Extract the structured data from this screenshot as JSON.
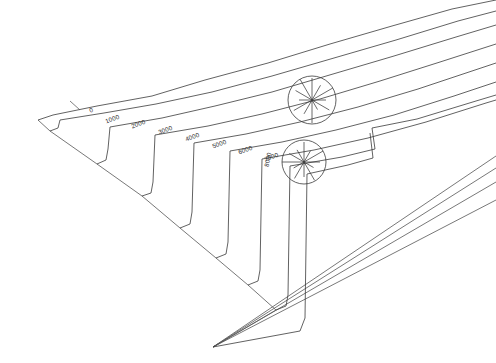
{
  "figure": {
    "background_color": "#ffffff",
    "line_color": "#3a3a3a",
    "faint_line_color": "#6e6e6e",
    "width": 496,
    "height": 363
  },
  "chart_data": {
    "type": "line",
    "title": "",
    "xlabel": "",
    "ylabel": "",
    "grid": false,
    "legend_position": "none",
    "contour_interval": 1000,
    "categories": [
      "0",
      "1000",
      "2000",
      "3000",
      "4000",
      "5000",
      "6000",
      "7000",
      "8000"
    ],
    "values": [
      0,
      1000,
      2000,
      3000,
      4000,
      5000,
      6000,
      7000,
      8000
    ],
    "series": [
      {
        "name": "contour-0",
        "label": "0",
        "label_x": 92,
        "label_y": 112,
        "label_rotation": -20,
        "path": "M 38 120 L 53 115 L 97 106 L 152 96 L 205 80 L 268 63 L 330 44 L 392 26 L 452 9 L 496 0"
      },
      {
        "name": "contour-1000",
        "label": "1000",
        "label_x": 113,
        "label_y": 121,
        "label_rotation": -20,
        "path": "M 50 131 L 58 128 L 60 120 L 104 113 L 156 104 L 212 92 L 272 76 L 334 58 L 396 40 L 458 21 L 496 11"
      },
      {
        "name": "contour-2000",
        "label": "2000",
        "label_x": 139,
        "label_y": 126,
        "label_rotation": -20,
        "path": "M 97 164 L 106 160 L 108 149 L 110 127 L 162 118 L 215 106 L 272 92 L 333 74 L 394 56 L 456 37 L 496 25"
      },
      {
        "name": "contour-3000",
        "label": "3000",
        "label_x": 166,
        "label_y": 132,
        "label_rotation": -20,
        "path": "M 142 196 L 151 193 L 153 182 L 155 135 L 208 126 L 262 114 L 320 99 L 380 81 L 440 62 L 496 44"
      },
      {
        "name": "contour-4000",
        "label": "4000",
        "label_x": 193,
        "label_y": 139,
        "label_rotation": -20,
        "path": "M 180 228 L 190 224 L 192 212 L 194 143 L 246 134 L 300 122 L 358 107 L 418 89 L 478 69 L 496 63"
      },
      {
        "name": "contour-5000",
        "label": "5000",
        "label_x": 220,
        "label_y": 146,
        "label_rotation": -20,
        "path": "M 216 258 L 226 254 L 228 242 L 230 151 L 282 142 L 336 130 L 394 115 L 454 96 L 496 82"
      },
      {
        "name": "contour-6000",
        "label": "6000",
        "label_x": 246,
        "label_y": 152,
        "label_rotation": -20,
        "path": "M 248 285 L 258 281 L 260 270 L 262 159 L 314 150 L 368 138 L 426 122 L 486 103 L 496 100"
      },
      {
        "name": "contour-7000",
        "label": "7000",
        "label_x": 272,
        "label_y": 159,
        "label_rotation": -20,
        "path": "M 276 310 L 286 306 L 288 295 L 290 166 L 342 157 L 375 149 L 372 128 L 417 119 L 476 101 L 496 95"
      },
      {
        "name": "contour-8000",
        "label": "8000",
        "label_x": 270,
        "label_y": 160,
        "label_rotation": -78,
        "path": "M 213 347 L 300 331 L 305 318 L 307 174 L 348 165 L 373 158 L 370 133"
      }
    ],
    "boundary_edges": [
      {
        "name": "left-outer-edge",
        "path": "M 38 120 L 50 131 L 97 164 L 142 196 L 180 228 L 216 258 L 248 285 L 276 310 L 213 347"
      },
      {
        "name": "ridge-to-apex-a",
        "path": "M 213 347 L 496 156"
      },
      {
        "name": "ridge-to-apex-b",
        "path": "M 213 347 L 496 168"
      },
      {
        "name": "ridge-to-apex-c",
        "path": "M 213 347 L 496 182"
      },
      {
        "name": "ridge-to-apex-d",
        "path": "M 213 347 L 496 200"
      }
    ],
    "leader_lines": [
      {
        "name": "leader-zero",
        "path": "M 70 101 L 80 110"
      }
    ],
    "rose_diagrams": [
      {
        "name": "rose-upper",
        "center_x": 312,
        "center_y": 100,
        "radius": 24,
        "spoke_count": 12,
        "spoke_lengths": [
          22,
          17,
          24,
          14,
          20,
          11,
          23,
          16,
          21,
          13,
          19,
          24
        ]
      },
      {
        "name": "rose-lower",
        "center_x": 304,
        "center_y": 162,
        "radius": 22,
        "spoke_count": 12,
        "spoke_lengths": [
          20,
          13,
          22,
          16,
          11,
          21,
          15,
          19,
          12,
          22,
          17,
          14
        ]
      }
    ]
  }
}
